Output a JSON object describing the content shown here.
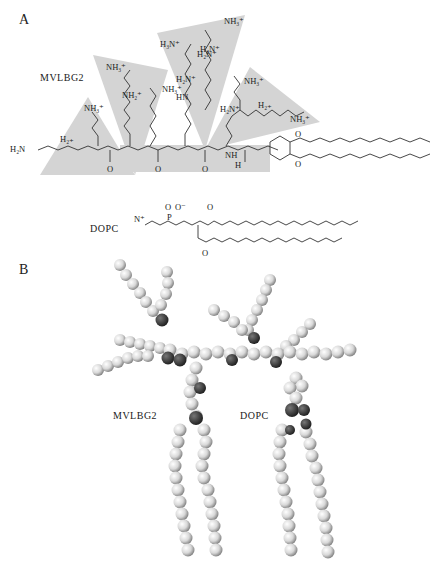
{
  "figure": {
    "panels": [
      {
        "label": "A",
        "description": "Chemical structures",
        "molecules": [
          {
            "name": "MVLBG2",
            "groups": [
              "NH3+",
              "H2N+",
              "HN",
              "NH",
              "H2+",
              "H2N",
              "O",
              "H"
            ]
          },
          {
            "name": "DOPC",
            "groups": [
              "N+",
              "O",
              "O-",
              "P",
              "O"
            ]
          }
        ]
      },
      {
        "label": "B",
        "description": "Space-filling models",
        "molecules": [
          {
            "name": "MVLBG2"
          },
          {
            "name": "DOPC"
          }
        ]
      }
    ],
    "chem_labels": {
      "nh3": "NH₃⁺",
      "h3n": "H₃N⁺",
      "h2n": "H₂N⁺",
      "nh2": "NH₂⁺",
      "hn": "HN",
      "nh": "NH",
      "h2plus": "H₂₊",
      "h2n_end": "H₂N",
      "o": "O",
      "ominus": "O⁻",
      "p": "P",
      "h": "H",
      "nplus": "N⁺"
    }
  }
}
